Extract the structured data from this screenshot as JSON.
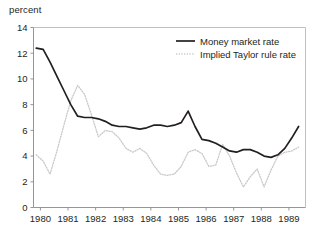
{
  "chart_data": {
    "type": "line",
    "title": "",
    "ylabel": "percent",
    "xlabel": "",
    "ylim": [
      0,
      14
    ],
    "xlim": [
      1979.75,
      1989.6
    ],
    "yticks": [
      0,
      2,
      4,
      6,
      8,
      10,
      12,
      14
    ],
    "ytick_labels": [
      "0",
      "2",
      "4",
      "6",
      "8",
      "10",
      "12",
      "14"
    ],
    "xticks": [
      1980,
      1981,
      1982,
      1983,
      1984,
      1985,
      1986,
      1987,
      1988,
      1989
    ],
    "xtick_labels": [
      "1980",
      "1981",
      "1982",
      "1983",
      "1984",
      "1985",
      "1986",
      "1987",
      "1988",
      "1989"
    ],
    "grid": false,
    "legend_position": "top-right",
    "series": [
      {
        "name": "Money market rate",
        "style": "solid",
        "color": "#231f20",
        "x": [
          1979.85,
          1980.1,
          1980.35,
          1980.6,
          1980.85,
          1981.1,
          1981.35,
          1981.6,
          1981.85,
          1982.1,
          1982.35,
          1982.6,
          1982.85,
          1983.1,
          1983.35,
          1983.6,
          1983.85,
          1984.1,
          1984.35,
          1984.6,
          1984.85,
          1985.1,
          1985.35,
          1985.6,
          1985.85,
          1986.1,
          1986.35,
          1986.6,
          1986.85,
          1987.1,
          1987.35,
          1987.6,
          1987.85,
          1988.1,
          1988.35,
          1988.6,
          1988.85,
          1989.1,
          1989.35
        ],
        "y": [
          12.4,
          12.3,
          11.3,
          10.2,
          9.1,
          8.0,
          7.1,
          7.0,
          7.0,
          6.9,
          6.7,
          6.4,
          6.3,
          6.3,
          6.2,
          6.1,
          6.2,
          6.4,
          6.4,
          6.3,
          6.4,
          6.6,
          7.5,
          6.3,
          5.3,
          5.2,
          5.0,
          4.7,
          4.4,
          4.3,
          4.5,
          4.5,
          4.3,
          4.0,
          3.9,
          4.1,
          4.6,
          5.4,
          6.3
        ]
      },
      {
        "name": "Implied Taylor rule rate",
        "style": "dotted",
        "color": "#c9c9c9",
        "x": [
          1979.85,
          1980.1,
          1980.35,
          1980.6,
          1980.85,
          1981.1,
          1981.35,
          1981.6,
          1981.85,
          1982.1,
          1982.35,
          1982.6,
          1982.85,
          1983.1,
          1983.35,
          1983.6,
          1983.85,
          1984.1,
          1984.35,
          1984.6,
          1984.85,
          1985.1,
          1985.35,
          1985.6,
          1985.85,
          1986.1,
          1986.35,
          1986.6,
          1986.85,
          1987.1,
          1987.35,
          1987.6,
          1987.85,
          1988.1,
          1988.35,
          1988.6,
          1988.85,
          1989.1,
          1989.35
        ],
        "y": [
          4.1,
          3.6,
          2.6,
          4.4,
          6.4,
          8.3,
          9.5,
          8.8,
          7.2,
          5.5,
          6.0,
          5.9,
          5.4,
          4.6,
          4.3,
          4.6,
          4.2,
          3.3,
          2.6,
          2.5,
          2.6,
          3.2,
          4.3,
          4.5,
          4.2,
          3.2,
          3.3,
          4.9,
          4.0,
          2.7,
          1.6,
          2.4,
          3.0,
          1.6,
          2.9,
          4.0,
          4.3,
          4.4,
          4.7
        ]
      }
    ]
  },
  "legend": {
    "entries": [
      {
        "label": "Money market rate",
        "style": "solid",
        "color": "#231f20"
      },
      {
        "label": "Implied Taylor rule rate",
        "style": "dotted",
        "color": "#c9c9c9"
      }
    ]
  },
  "axis": {
    "y_title": "percent"
  }
}
